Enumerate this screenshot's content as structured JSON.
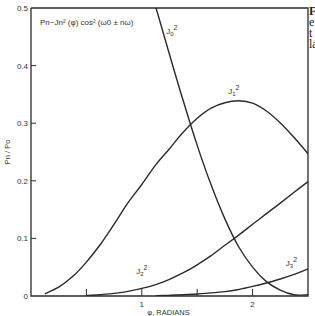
{
  "chart_data": {
    "type": "line",
    "title": "",
    "annotation": "Pn~Jn² (φ) cos² (ω0 ± nω)",
    "xlabel": "φ, RADIANS",
    "ylabel": "Pn / Po",
    "xlim": [
      0,
      2.5
    ],
    "ylim": [
      0,
      0.5
    ],
    "x_ticks": [
      0.5,
      1,
      1.5,
      2
    ],
    "x_tick_labels": [
      "",
      "1",
      "",
      "2"
    ],
    "y_ticks": [
      0,
      0.1,
      0.2,
      0.3,
      0.4,
      0.5
    ],
    "y_tick_labels": [
      "0",
      "0.1",
      "0.2",
      "0.3",
      "0.4",
      "0.5"
    ],
    "grid": false,
    "legend": "inline labels",
    "x": [
      0,
      0.125,
      0.25,
      0.375,
      0.5,
      0.625,
      0.75,
      0.875,
      1.0,
      1.125,
      1.25,
      1.375,
      1.5,
      1.625,
      1.75,
      1.875,
      2.0,
      2.125,
      2.25,
      2.375,
      2.5
    ],
    "series": [
      {
        "name": "J0²",
        "label_x": 1.22,
        "label_y": 0.455,
        "values": [
          1.0,
          0.992,
          0.969,
          0.931,
          0.88,
          0.818,
          0.746,
          0.667,
          0.5855,
          0.502,
          0.4193,
          0.338,
          0.2615,
          0.193,
          0.1338,
          0.085,
          0.0501,
          0.025,
          0.0103,
          0.0021,
          0.0023
        ]
      },
      {
        "name": "J1²",
        "label_x": 1.78,
        "label_y": 0.35,
        "values": [
          0,
          0.0039,
          0.0153,
          0.0336,
          0.0588,
          0.0894,
          0.1247,
          0.1617,
          0.1936,
          0.2276,
          0.2558,
          0.2848,
          0.3085,
          0.3262,
          0.3356,
          0.3389,
          0.3347,
          0.3211,
          0.3005,
          0.2752,
          0.247
        ]
      },
      {
        "name": "J2²",
        "label_x": 0.95,
        "label_y": 0.038,
        "values": [
          0,
          2e-05,
          6e-05,
          0.0003,
          0.00094,
          0.0022,
          0.0046,
          0.008,
          0.01321,
          0.0198,
          0.029,
          0.0404,
          0.0541,
          0.07,
          0.088,
          0.1058,
          0.1245,
          0.143,
          0.1613,
          0.18,
          0.1988
        ]
      },
      {
        "name": "J3²",
        "label_x": 2.3,
        "label_y": 0.052,
        "values": [
          0,
          0,
          0,
          0,
          1e-05,
          3e-05,
          0.0001,
          0.0002,
          0.00038,
          0.0007,
          0.0013,
          0.0022,
          0.0035,
          0.0053,
          0.0077,
          0.0113,
          0.0166,
          0.0225,
          0.0295,
          0.0375,
          0.0468
        ]
      }
    ]
  },
  "side_text": {
    "lines": [
      "F",
      "e",
      "t",
      "la"
    ]
  }
}
